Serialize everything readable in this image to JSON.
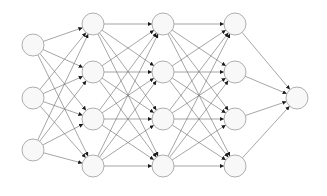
{
  "diagram": {
    "type": "fully-connected-network",
    "colors": {
      "background": "#ffffff",
      "node_fill": "#f8f8f8",
      "node_stroke": "#9a9a9a",
      "edge": "#6a6a6a",
      "arrowhead": "#1a1a1a"
    },
    "node_radius": 11,
    "layers": [
      {
        "name": "input",
        "x": 33,
        "ys": [
          45,
          98,
          150
        ]
      },
      {
        "name": "hidden-1",
        "x": 93,
        "ys": [
          24,
          72,
          119,
          166
        ]
      },
      {
        "name": "hidden-2",
        "x": 163,
        "ys": [
          24,
          72,
          119,
          166
        ]
      },
      {
        "name": "hidden-3",
        "x": 235,
        "ys": [
          24,
          72,
          119,
          166
        ]
      },
      {
        "name": "output",
        "x": 297,
        "ys": [
          98
        ]
      }
    ]
  }
}
